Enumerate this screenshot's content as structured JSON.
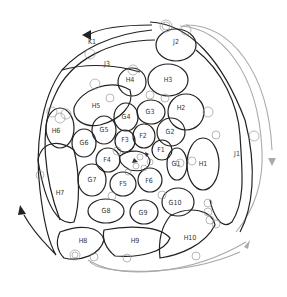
{
  "diagram": {
    "type": "spiral-region-map",
    "colors": {
      "dark_stroke": "#222222",
      "grey_stroke": "#aaaaaa",
      "node_circle": "#888888",
      "label": "#333333",
      "background": "#ffffff"
    },
    "regions": [
      {
        "id": "F1",
        "x": 161,
        "y": 150
      },
      {
        "id": "F2",
        "x": 143,
        "y": 136
      },
      {
        "id": "F3",
        "x": 125,
        "y": 140
      },
      {
        "id": "F4",
        "x": 107,
        "y": 160
      },
      {
        "id": "F5",
        "x": 123,
        "y": 184
      },
      {
        "id": "F6",
        "x": 149,
        "y": 181
      },
      {
        "id": "G1",
        "x": 176,
        "y": 164
      },
      {
        "id": "G2",
        "x": 170,
        "y": 132
      },
      {
        "id": "G3",
        "x": 150,
        "y": 112
      },
      {
        "id": "G4",
        "x": 126,
        "y": 117
      },
      {
        "id": "G5",
        "x": 104,
        "y": 130
      },
      {
        "id": "G6",
        "x": 84,
        "y": 143
      },
      {
        "id": "G7",
        "x": 92,
        "y": 180
      },
      {
        "id": "G8",
        "x": 106,
        "y": 211
      },
      {
        "id": "G9",
        "x": 143,
        "y": 213
      },
      {
        "id": "G10",
        "x": 175,
        "y": 203
      },
      {
        "id": "H1",
        "x": 203,
        "y": 164
      },
      {
        "id": "H2",
        "x": 181,
        "y": 108
      },
      {
        "id": "H3",
        "x": 168,
        "y": 80
      },
      {
        "id": "H4",
        "x": 130,
        "y": 80
      },
      {
        "id": "H5",
        "x": 96,
        "y": 106
      },
      {
        "id": "H6",
        "x": 56,
        "y": 131
      },
      {
        "id": "H7",
        "x": 60,
        "y": 193
      },
      {
        "id": "H8",
        "x": 83,
        "y": 241
      },
      {
        "id": "H9",
        "x": 135,
        "y": 241
      },
      {
        "id": "H10",
        "x": 190,
        "y": 238
      },
      {
        "id": "J1",
        "x": 237,
        "y": 154
      },
      {
        "id": "J2",
        "x": 176,
        "y": 42
      },
      {
        "id": "J3",
        "x": 107,
        "y": 64
      },
      {
        "id": "K1",
        "x": 92,
        "y": 42
      }
    ]
  }
}
